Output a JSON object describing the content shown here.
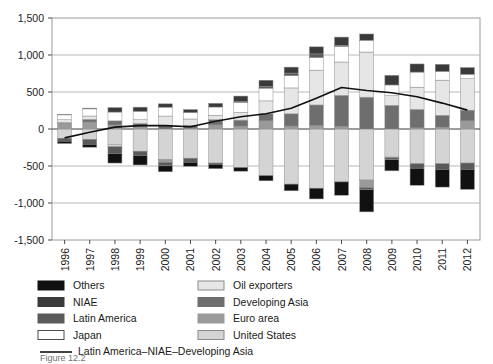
{
  "chart_data": {
    "type": "bar",
    "subtype": "stacked-bar-with-line-overlay",
    "title": "",
    "xlabel": "",
    "ylabel": "",
    "ylim": [
      -1500,
      1500
    ],
    "ytick_values": [
      -1500,
      -1000,
      -500,
      0,
      500,
      1000,
      1500
    ],
    "ytick_labels": [
      "-1,500",
      "-1,000",
      "-500",
      "0",
      "500",
      "1,000",
      "1,500"
    ],
    "grid": true,
    "grid_axis": "y",
    "legend_position": "below-plot",
    "categories": [
      "1996",
      "1997",
      "1998",
      "1999",
      "2000",
      "2001",
      "2002",
      "2003",
      "2004",
      "2005",
      "2006",
      "2007",
      "2008",
      "2009",
      "2010",
      "2011",
      "2012"
    ],
    "series": [
      {
        "name": "United States",
        "color": "#d4d4d4",
        "values": [
          -125,
          -140,
          -215,
          -300,
          -415,
          -395,
          -460,
          -520,
          -630,
          -745,
          -800,
          -715,
          -690,
          -380,
          -470,
          -470,
          -460
        ]
      },
      {
        "name": "Euro area",
        "color": "#9a9a9a",
        "values": [
          80,
          95,
          55,
          30,
          -35,
          10,
          55,
          40,
          110,
          40,
          45,
          35,
          -100,
          -10,
          15,
          25,
          110
        ]
      },
      {
        "name": "Developing Asia",
        "color": "#6e6e6e",
        "values": [
          5,
          35,
          55,
          45,
          45,
          40,
          70,
          80,
          95,
          165,
          280,
          420,
          430,
          320,
          250,
          160,
          145
        ]
      },
      {
        "name": "Oil exporters",
        "color": "#e6e6e6",
        "values": [
          40,
          45,
          -25,
          50,
          130,
          85,
          60,
          105,
          175,
          350,
          470,
          450,
          610,
          130,
          300,
          475,
          425
        ]
      },
      {
        "name": "Japan",
        "color": "#ffffff",
        "values": [
          66,
          97,
          119,
          115,
          120,
          88,
          112,
          136,
          172,
          166,
          171,
          212,
          159,
          145,
          204,
          119,
          60
        ]
      },
      {
        "name": "Latin America",
        "color": "#5a5a5a",
        "values": [
          -40,
          -66,
          -90,
          -56,
          -48,
          -54,
          -16,
          9,
          22,
          35,
          49,
          15,
          -30,
          -25,
          -60,
          -75,
          -85
        ]
      },
      {
        "name": "NIAE",
        "color": "#3a3a3a",
        "values": [
          5,
          10,
          60,
          55,
          45,
          40,
          50,
          75,
          85,
          80,
          95,
          110,
          85,
          130,
          110,
          95,
          90
        ]
      },
      {
        "name": "Others",
        "color": "#111111",
        "values": [
          -31,
          -40,
          -130,
          -130,
          -80,
          -55,
          -60,
          -50,
          -70,
          -90,
          -145,
          -180,
          -300,
          -150,
          -230,
          -240,
          -270
        ]
      }
    ],
    "line_series": {
      "name": "Latin America–NIAE–Developing Asia",
      "color": "#111111",
      "x": [
        "1996",
        "1997",
        "1998",
        "1999",
        "2000",
        "2001",
        "2002",
        "2003",
        "2004",
        "2005",
        "2006",
        "2007",
        "2008",
        "2009",
        "2010",
        "2011",
        "2012"
      ],
      "values": [
        -120,
        -45,
        25,
        45,
        45,
        30,
        105,
        165,
        205,
        280,
        415,
        560,
        520,
        490,
        435,
        350,
        255
      ]
    }
  },
  "legend": {
    "left_column": [
      {
        "label": "Others",
        "swatch": "#111111",
        "border": "#111111"
      },
      {
        "label": "NIAE",
        "swatch": "#3a3a3a",
        "border": "#3a3a3a"
      },
      {
        "label": "Latin America",
        "swatch": "#5a5a5a",
        "border": "#5a5a5a"
      },
      {
        "label": "Japan",
        "swatch": "#ffffff",
        "border": "#4a4a4a"
      }
    ],
    "right_column": [
      {
        "label": "Oil exporters",
        "swatch": "#e6e6e6",
        "border": "#8a8a8a"
      },
      {
        "label": "Developing Asia",
        "swatch": "#6e6e6e",
        "border": "#6e6e6e"
      },
      {
        "label": "Euro area",
        "swatch": "#9a9a9a",
        "border": "#9a9a9a"
      },
      {
        "label": "United States",
        "swatch": "#d4d4d4",
        "border": "#8a8a8a"
      }
    ],
    "line_entry": {
      "label": "Latin America–NIAE–Developing Asia",
      "color": "#111111"
    }
  },
  "caption": {
    "text": "Figure 12.2"
  }
}
